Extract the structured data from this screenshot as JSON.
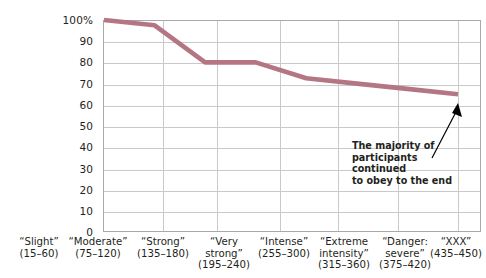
{
  "chart_data": {
    "type": "line",
    "title": "",
    "xlabel": "",
    "ylabel": "",
    "ylim": [
      0,
      100
    ],
    "yticks": [
      0,
      10,
      20,
      30,
      40,
      50,
      60,
      70,
      80,
      90,
      100
    ],
    "ytick_labels": [
      "0",
      "10",
      "20",
      "30",
      "40",
      "50",
      "60",
      "70",
      "80",
      "90",
      "100%"
    ],
    "grid": true,
    "legend": "none",
    "series_color": "#b57684",
    "categories": [
      "“Slight”",
      "“Moderate”",
      "“Strong”",
      "“Very strong”",
      "“Intense”",
      "“Extreme intensity”",
      "“Danger: severe”",
      "“XXX”"
    ],
    "category_ranges": [
      "(15–60)",
      "(75–120)",
      "(135–180)",
      "(195–240)",
      "(255–300)",
      "(315–360)",
      "(375–420)",
      "(435–450)"
    ],
    "series": [
      {
        "name": "Participants still obeying",
        "values": [
          100,
          97.5,
          80,
          80,
          72.5,
          70,
          67.5,
          65
        ]
      }
    ],
    "annotations": [
      {
        "text": "The majority of participants continued to obey to the end",
        "arrow": "up-right"
      }
    ]
  },
  "axes": {
    "y_tick_labels": [
      "100%",
      "90",
      "80",
      "70",
      "60",
      "50",
      "40",
      "30",
      "20",
      "10",
      "0"
    ],
    "x_categories": [
      {
        "name": "“Slight”",
        "range": "(15–60)"
      },
      {
        "name": "“Moderate”",
        "range": "(75–120)"
      },
      {
        "name": "“Strong”",
        "range": "(135–180)"
      },
      {
        "name": "“Very strong”",
        "range": "(195–240)"
      },
      {
        "name": "“Intense”",
        "range": "(255–300)"
      },
      {
        "name": "“Extreme intensity”",
        "range": "(315–360)"
      },
      {
        "name": "“Danger: severe”",
        "range": "(375–420)"
      },
      {
        "name": "“XXX”",
        "range": "(435–450)"
      }
    ]
  },
  "annotation": {
    "line1": "The majority of",
    "line2": "participants continued",
    "line3": "to obey to the end"
  },
  "colors": {
    "series": "#b57684",
    "grid": "#c9c9c9",
    "frame": "#a9a9a9",
    "text": "#231f20",
    "background": "#ffffff"
  }
}
